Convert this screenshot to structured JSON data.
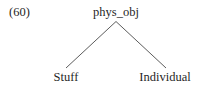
{
  "figure": {
    "kind": "syntax-tree",
    "example_number": "(60)",
    "background_color": "#ffffff",
    "text_color": "#1f1f1f",
    "line_color": "#4a4a4a"
  },
  "tree": {
    "root": {
      "label": "phys_obj"
    },
    "leaves": [
      {
        "label": "Stuff"
      },
      {
        "label": "Individual"
      }
    ],
    "edges": [
      {
        "from": "phys_obj",
        "to": "Stuff"
      },
      {
        "from": "phys_obj",
        "to": "Individual"
      }
    ]
  }
}
